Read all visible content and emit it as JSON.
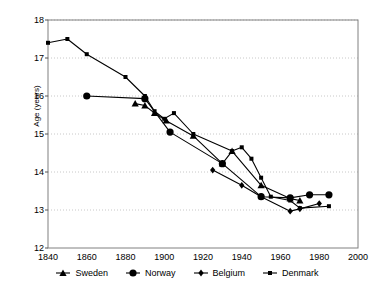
{
  "chart_data": {
    "type": "line",
    "title": "",
    "subtitle": "",
    "xlabel": "",
    "ylabel": "Age (years)",
    "xlim": [
      1840,
      2000
    ],
    "ylim": [
      12,
      18
    ],
    "xticks": [
      1840,
      1860,
      1880,
      1900,
      1920,
      1940,
      1960,
      1980,
      2000
    ],
    "yticks": [
      12,
      13,
      14,
      15,
      16,
      17,
      18
    ],
    "grid": "horizontal-dotted",
    "legend_position": "bottom",
    "series": [
      {
        "name": "Sweden",
        "marker": "triangle",
        "color": "#000000",
        "points": [
          [
            1885,
            15.8
          ],
          [
            1890,
            15.75
          ],
          [
            1895,
            15.55
          ],
          [
            1901,
            15.35
          ],
          [
            1915,
            14.95
          ],
          [
            1930,
            14.22
          ],
          [
            1935,
            14.55
          ],
          [
            1950,
            13.65
          ],
          [
            1965,
            13.3
          ],
          [
            1970,
            13.25
          ]
        ]
      },
      {
        "name": "Norway",
        "marker": "circle",
        "color": "#000000",
        "points": [
          [
            1860,
            16.0
          ],
          [
            1890,
            15.93
          ],
          [
            1903,
            15.05
          ],
          [
            1930,
            14.22
          ],
          [
            1950,
            13.35
          ],
          [
            1965,
            13.32
          ],
          [
            1975,
            13.4
          ],
          [
            1985,
            13.4
          ]
        ]
      },
      {
        "name": "Belgium",
        "marker": "diamond",
        "color": "#000000",
        "points": [
          [
            1925,
            14.05
          ],
          [
            1940,
            13.65
          ],
          [
            1950,
            13.35
          ],
          [
            1965,
            12.97
          ],
          [
            1970,
            13.03
          ],
          [
            1980,
            13.17
          ]
        ]
      },
      {
        "name": "Denmark",
        "marker": "square",
        "color": "#000000",
        "points": [
          [
            1840,
            17.4
          ],
          [
            1850,
            17.5
          ],
          [
            1860,
            17.1
          ],
          [
            1880,
            16.5
          ],
          [
            1890,
            16.0
          ],
          [
            1895,
            15.6
          ],
          [
            1900,
            15.4
          ],
          [
            1905,
            15.55
          ],
          [
            1915,
            15.0
          ],
          [
            1935,
            14.55
          ],
          [
            1940,
            14.65
          ],
          [
            1945,
            14.35
          ],
          [
            1950,
            13.85
          ],
          [
            1955,
            13.35
          ],
          [
            1965,
            13.25
          ],
          [
            1970,
            13.05
          ],
          [
            1985,
            13.1
          ]
        ]
      }
    ]
  },
  "axes": {
    "y_title": "Age (years)",
    "y_labels": [
      "18",
      "17",
      "16",
      "15",
      "14",
      "13",
      "12"
    ],
    "x_labels": [
      "1840",
      "1860",
      "1880",
      "1900",
      "1920",
      "1940",
      "1960",
      "1980",
      "2000"
    ]
  },
  "legend": {
    "items": [
      {
        "label": "Sweden",
        "marker": "triangle"
      },
      {
        "label": "Norway",
        "marker": "circle"
      },
      {
        "label": "Belgium",
        "marker": "diamond"
      },
      {
        "label": "Denmark",
        "marker": "square"
      }
    ]
  },
  "colors": {
    "series": "#000000",
    "frame": "#808080",
    "grid": "#c8c8c8",
    "background": "#ffffff"
  }
}
